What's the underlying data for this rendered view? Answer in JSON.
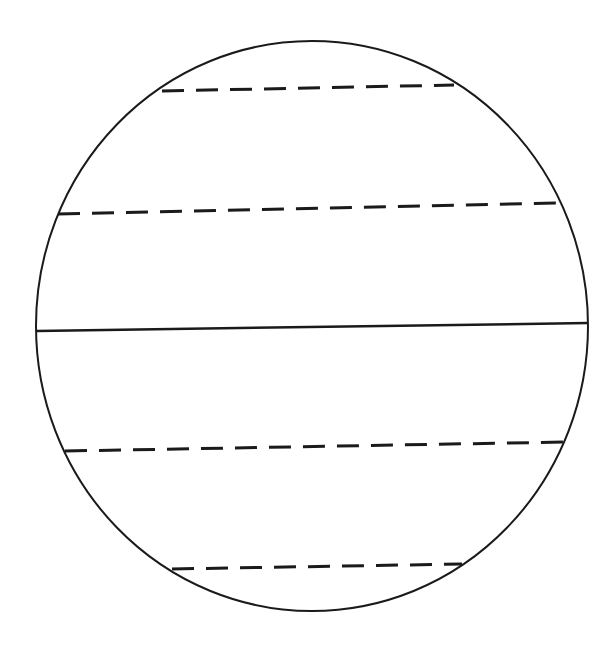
{
  "diagram": {
    "title": "",
    "background": "#ffffff",
    "stroke_color": "#1a1a1a",
    "circle": {
      "cx": 312,
      "cy": 326,
      "rx": 276,
      "ry": 285,
      "stroke_width": 2
    },
    "lines": [
      {
        "name": "dashed-line-1",
        "style": "dashed",
        "x1": 162,
        "y1": 91,
        "x2": 454,
        "y2": 85
      },
      {
        "name": "dashed-line-2",
        "style": "dashed",
        "x1": 58,
        "y1": 214,
        "x2": 558,
        "y2": 203
      },
      {
        "name": "solid-diameter-line",
        "style": "solid",
        "x1": 37,
        "y1": 331,
        "x2": 588,
        "y2": 323
      },
      {
        "name": "dashed-line-3",
        "style": "dashed",
        "x1": 65,
        "y1": 451,
        "x2": 564,
        "y2": 442
      },
      {
        "name": "dashed-line-4",
        "style": "dashed",
        "x1": 172,
        "y1": 569,
        "x2": 462,
        "y2": 564
      }
    ]
  }
}
